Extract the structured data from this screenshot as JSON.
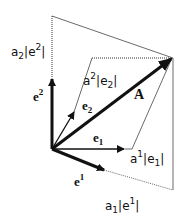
{
  "diagram": {
    "labels": {
      "a2_e2": {
        "base": "a",
        "sub": "2",
        "mid": "|e",
        "sup": "2",
        "end": "|"
      },
      "e_sup2": {
        "base": "e",
        "sup": "2"
      },
      "a_sup2_e2": {
        "pre_sup": "2",
        "base": "a",
        "mid": "|e",
        "sub": "2",
        "end": "|"
      },
      "e_sub2": {
        "base": "e",
        "sub": "2"
      },
      "A": "A",
      "e_sub1": {
        "base": "e",
        "sub": "1"
      },
      "a_sup1_e1": {
        "base": "a",
        "sup": "1",
        "mid": "|e",
        "sub": "1",
        "end": "|"
      },
      "e_sup1": {
        "base": "e",
        "sup": "1"
      },
      "a1_e1": {
        "base": "a",
        "sub": "1",
        "mid": "|e",
        "sup": "1",
        "end": "|"
      }
    },
    "colors": {
      "stroke": "#111111",
      "thin": "#333333",
      "background": "#ffffff"
    }
  }
}
